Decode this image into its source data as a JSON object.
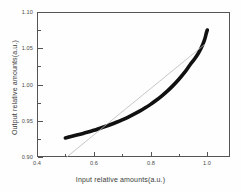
{
  "chart_data": {
    "type": "line",
    "title": "",
    "xlabel": "Input relative amounts(a.u.)",
    "ylabel": "Output relative amounts(a.u.)",
    "xlim": [
      0.4,
      1.08
    ],
    "ylim": [
      0.9,
      1.1
    ],
    "xticks": [
      0.4,
      0.6,
      0.8,
      1.0
    ],
    "xticklabels": [
      "0.4",
      "0.6",
      "0.8",
      "1.0"
    ],
    "xminorticks": [
      0.5,
      0.7,
      0.9
    ],
    "yticks": [
      0.9,
      0.95,
      1.0,
      1.05,
      1.1
    ],
    "yticklabels": [
      "0.90",
      "0.95",
      "1.00",
      "1.05",
      "1.10"
    ],
    "yminorticks": [
      0.925,
      0.975,
      1.025,
      1.075
    ],
    "grid": false,
    "legend": false,
    "series": [
      {
        "name": "measured response",
        "style": "thick-black-band",
        "color": "#111111",
        "linewidth": 3.6,
        "x": [
          0.5,
          0.52,
          0.54,
          0.56,
          0.58,
          0.6,
          0.62,
          0.64,
          0.66,
          0.68,
          0.7,
          0.72,
          0.74,
          0.76,
          0.78,
          0.8,
          0.82,
          0.84,
          0.86,
          0.88,
          0.9,
          0.92,
          0.94,
          0.955,
          0.968,
          0.978,
          0.986,
          0.992,
          0.996,
          1.0
        ],
        "y": [
          0.9262,
          0.9283,
          0.9303,
          0.9322,
          0.9344,
          0.9368,
          0.9394,
          0.942,
          0.9448,
          0.9479,
          0.9512,
          0.9548,
          0.9588,
          0.963,
          0.9676,
          0.9726,
          0.9782,
          0.9844,
          0.9912,
          0.9988,
          1.0072,
          1.0166,
          1.0276,
          1.0352,
          1.0428,
          1.05,
          1.057,
          1.0638,
          1.07,
          1.0752
        ]
      },
      {
        "name": "linear reference",
        "style": "thin-gray-line",
        "color": "#b9b9b9",
        "linewidth": 0.8,
        "x": [
          0.505,
          0.99
        ],
        "y": [
          0.9,
          1.055
        ]
      }
    ]
  }
}
